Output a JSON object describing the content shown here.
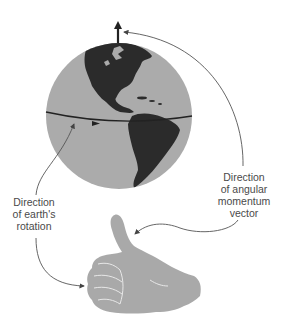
{
  "figure": {
    "type": "diagram",
    "colors": {
      "ocean": "#ababab",
      "land": "#2b2b2b",
      "hand": "#a9a9a9",
      "hand_creases": "#e8e8e8",
      "axis_arrow": "#222222",
      "connector_lines": "#555555",
      "label_text": "#4a4a4a"
    },
    "elements": {
      "globe": {
        "name": "Earth globe showing the Americas"
      },
      "axis_arrow": {
        "name": "Angular momentum vector (up through North Pole)"
      },
      "equator_line": {
        "name": "Equator with rotation direction arrow"
      },
      "hand": {
        "name": "Right hand, thumbs-up, fingers curled"
      }
    },
    "labels": {
      "rotation": {
        "line1": "Direction",
        "line2": "of earth's",
        "line3": "rotation"
      },
      "angular_momentum": {
        "line1": "Direction",
        "line2": "of angular",
        "line3": "momentum",
        "line4": "vector"
      }
    }
  }
}
